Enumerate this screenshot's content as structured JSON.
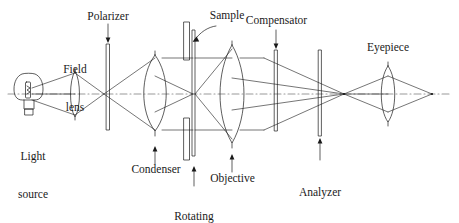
{
  "figure": {
    "background_color": "#ffffff",
    "stroke_color": "#1a1a1a",
    "axis_color": "#9a9a9a",
    "width": 459,
    "height": 223
  },
  "labels": {
    "light_source_line1": "Light",
    "light_source_line2": "source",
    "field_lens_line1": "Field",
    "field_lens_line2": "lens",
    "polarizer": "Polarizer",
    "condenser": "Condenser",
    "sample": "Sample",
    "rotating_stage_line1": "Rotating",
    "rotating_stage_line2": "stage",
    "objective": "Objective",
    "compensator": "Compensator",
    "analyzer_line1": "Analyzer",
    "analyzer_line2": "(rotating)",
    "eyepiece": "Eyepiece"
  },
  "components": [
    {
      "name": "light-source",
      "kind": "bulb",
      "x": 30,
      "label": "Light source"
    },
    {
      "name": "field-lens",
      "kind": "thin-lens",
      "x": 75,
      "label": "Field lens"
    },
    {
      "name": "polarizer",
      "kind": "plate",
      "x": 108,
      "label": "Polarizer"
    },
    {
      "name": "condenser",
      "kind": "thick-lens",
      "x": 155,
      "label": "Condenser"
    },
    {
      "name": "sample",
      "kind": "specimen",
      "x": 188,
      "label": "Sample"
    },
    {
      "name": "rotating-stage",
      "kind": "stage",
      "x": 194,
      "label": "Rotating stage"
    },
    {
      "name": "objective",
      "kind": "thick-lens",
      "x": 232,
      "label": "Objective"
    },
    {
      "name": "compensator",
      "kind": "plate",
      "x": 276,
      "label": "Compensator"
    },
    {
      "name": "analyzer",
      "kind": "plate",
      "x": 320,
      "label": "Analyzer (rotating)"
    },
    {
      "name": "eyepiece",
      "kind": "lens",
      "x": 388,
      "label": "Eyepiece"
    }
  ],
  "optical_axis": {
    "y": 94,
    "x_start": 8,
    "x_end": 452,
    "style": "dash-dot"
  }
}
